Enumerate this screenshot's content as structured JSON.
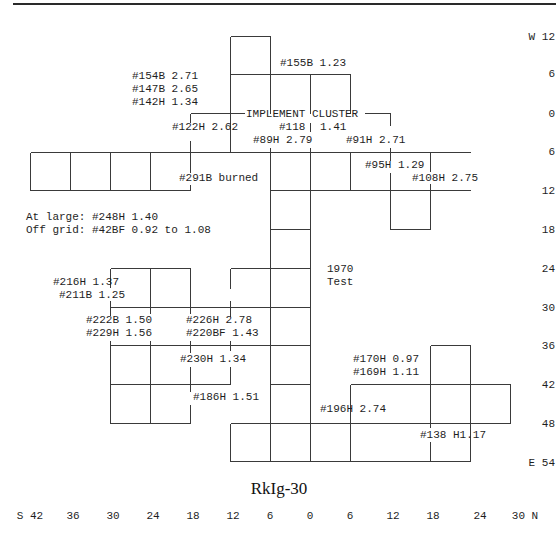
{
  "title": "RkIg-30",
  "colors": {
    "line": "#3a3a3a",
    "text": "#1e1e1e",
    "background": "#ffffff"
  },
  "axes": {
    "bottom": {
      "ticks": [
        {
          "label": "S 42",
          "x": 30,
          "y": 519
        },
        {
          "label": "36",
          "x": 73,
          "y": 519
        },
        {
          "label": "30",
          "x": 113,
          "y": 519
        },
        {
          "label": "24",
          "x": 153,
          "y": 519
        },
        {
          "label": "18",
          "x": 193,
          "y": 519
        },
        {
          "label": "12",
          "x": 233,
          "y": 519
        },
        {
          "label": "6",
          "x": 270,
          "y": 519
        },
        {
          "label": "0",
          "x": 310,
          "y": 519
        },
        {
          "label": "6",
          "x": 350,
          "y": 519
        },
        {
          "label": "12",
          "x": 393,
          "y": 519
        },
        {
          "label": "18",
          "x": 433,
          "y": 519
        },
        {
          "label": "24",
          "x": 480,
          "y": 519
        },
        {
          "label": "30 N",
          "x": 525,
          "y": 519
        }
      ]
    },
    "right": {
      "ticks": [
        {
          "label": "W 12",
          "x": 555,
          "y": 40
        },
        {
          "label": "6",
          "x": 555,
          "y": 77
        },
        {
          "label": "0",
          "x": 555,
          "y": 117
        },
        {
          "label": "6",
          "x": 555,
          "y": 155
        },
        {
          "label": "12",
          "x": 555,
          "y": 194
        },
        {
          "label": "18",
          "x": 555,
          "y": 233
        },
        {
          "label": "24",
          "x": 555,
          "y": 272
        },
        {
          "label": "30",
          "x": 555,
          "y": 311
        },
        {
          "label": "36",
          "x": 555,
          "y": 349
        },
        {
          "label": "42",
          "x": 555,
          "y": 388
        },
        {
          "label": "48",
          "x": 555,
          "y": 427
        },
        {
          "label": "E 54",
          "x": 555,
          "y": 466
        }
      ]
    }
  },
  "labels": [
    {
      "text": "#154B 2.71",
      "x": 132,
      "y": 79
    },
    {
      "text": "#147B 2.65",
      "x": 132,
      "y": 92
    },
    {
      "text": "#142H 1.34",
      "x": 132,
      "y": 105
    },
    {
      "text": "#155B 1.23",
      "x": 280,
      "y": 66
    },
    {
      "text": "IMPLEMENT CLUSTER",
      "x": 246,
      "y": 117,
      "bg": true
    },
    {
      "text": "#122H 2.62",
      "x": 172,
      "y": 130
    },
    {
      "text": "#118",
      "x": 279,
      "y": 130
    },
    {
      "text": "1.41",
      "x": 320,
      "y": 130
    },
    {
      "text": "#89H 2.79",
      "x": 253,
      "y": 143
    },
    {
      "text": "#91H 2.71",
      "x": 346,
      "y": 143
    },
    {
      "text": "#95H 1.29",
      "x": 365,
      "y": 168
    },
    {
      "text": "#108H 2.75",
      "x": 412,
      "y": 181
    },
    {
      "text": "#291B burned",
      "x": 179,
      "y": 181
    },
    {
      "text": "At large: #248H 1.40",
      "x": 26,
      "y": 220
    },
    {
      "text": "Off grid: #42BF 0.92 to 1.08",
      "x": 26,
      "y": 233
    },
    {
      "text": "1970",
      "x": 327,
      "y": 272
    },
    {
      "text": "Test",
      "x": 327,
      "y": 285
    },
    {
      "text": "#216H 1.37",
      "x": 53,
      "y": 285
    },
    {
      "text": "#211B 1.25",
      "x": 59,
      "y": 298
    },
    {
      "text": "#222B 1.50",
      "x": 86,
      "y": 323
    },
    {
      "text": "#229H 1.56",
      "x": 86,
      "y": 336
    },
    {
      "text": "#226H 2.78",
      "x": 186,
      "y": 323
    },
    {
      "text": "#220BF 1.43",
      "x": 186,
      "y": 336
    },
    {
      "text": "#230H 1.34",
      "x": 180,
      "y": 362
    },
    {
      "text": "#186H 1.51",
      "x": 193,
      "y": 400
    },
    {
      "text": "#170H 0.97",
      "x": 353,
      "y": 362
    },
    {
      "text": "#169H 1.11",
      "x": 353,
      "y": 375
    },
    {
      "text": "#196H 2.74",
      "x": 320,
      "y": 412
    },
    {
      "text": "#138 H1.17",
      "x": 420,
      "y": 438
    }
  ],
  "grid_segments": [
    [
      12,
      3,
      555,
      3,
      "top-rule"
    ],
    [
      230,
      36,
      270,
      36
    ],
    [
      230,
      36,
      230,
      152
    ],
    [
      270,
      36,
      270,
      113
    ],
    [
      230,
      74,
      350,
      74
    ],
    [
      310,
      74,
      310,
      113
    ],
    [
      350,
      74,
      350,
      113
    ],
    [
      190,
      113,
      244,
      113
    ],
    [
      364,
      113,
      390,
      113
    ],
    [
      190,
      113,
      190,
      122
    ],
    [
      390,
      113,
      390,
      125
    ],
    [
      310,
      122,
      310,
      131
    ],
    [
      30,
      152,
      470,
      152
    ],
    [
      30,
      190,
      190,
      190
    ],
    [
      270,
      190,
      470,
      190
    ],
    [
      30,
      152,
      30,
      190
    ],
    [
      70,
      152,
      70,
      190
    ],
    [
      110,
      152,
      110,
      190
    ],
    [
      150,
      152,
      150,
      190
    ],
    [
      190,
      140,
      190,
      172
    ],
    [
      190,
      184,
      190,
      190
    ],
    [
      270,
      147,
      270,
      461
    ],
    [
      310,
      147,
      310,
      461
    ],
    [
      350,
      152,
      350,
      190
    ],
    [
      390,
      147,
      390,
      160
    ],
    [
      390,
      172,
      390,
      229
    ],
    [
      430,
      152,
      430,
      171
    ],
    [
      430,
      183,
      430,
      229
    ],
    [
      390,
      229,
      430,
      229
    ],
    [
      270,
      229,
      310,
      229
    ],
    [
      230,
      268,
      310,
      268
    ],
    [
      230,
      268,
      230,
      288
    ],
    [
      230,
      300,
      230,
      316
    ],
    [
      110,
      268,
      190,
      268
    ],
    [
      110,
      268,
      110,
      287
    ],
    [
      110,
      300,
      110,
      315
    ],
    [
      150,
      268,
      150,
      313
    ],
    [
      190,
      268,
      190,
      313
    ],
    [
      110,
      307,
      310,
      307
    ],
    [
      110,
      340,
      110,
      423
    ],
    [
      150,
      340,
      150,
      423
    ],
    [
      190,
      340,
      190,
      352
    ],
    [
      190,
      366,
      190,
      391
    ],
    [
      190,
      404,
      190,
      423
    ],
    [
      230,
      340,
      230,
      350
    ],
    [
      230,
      366,
      230,
      384
    ],
    [
      110,
      345,
      310,
      345
    ],
    [
      110,
      384,
      230,
      384
    ],
    [
      110,
      423,
      190,
      423
    ],
    [
      270,
      384,
      310,
      384
    ],
    [
      230,
      423,
      310,
      423
    ],
    [
      230,
      423,
      230,
      461
    ],
    [
      230,
      461,
      310,
      461
    ],
    [
      430,
      345,
      470,
      345
    ],
    [
      430,
      345,
      430,
      427
    ],
    [
      470,
      345,
      470,
      461
    ],
    [
      350,
      384,
      510,
      384
    ],
    [
      350,
      384,
      350,
      461
    ],
    [
      510,
      384,
      510,
      423
    ],
    [
      310,
      423,
      510,
      423
    ],
    [
      310,
      423,
      310,
      461
    ],
    [
      430,
      441,
      430,
      461
    ],
    [
      310,
      461,
      470,
      461
    ]
  ]
}
